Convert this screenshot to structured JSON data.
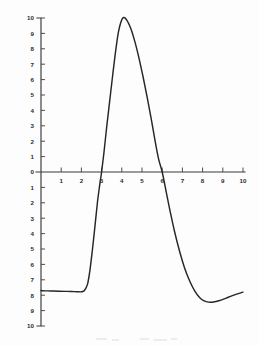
{
  "figure": {
    "title": "",
    "background_color": "#fdfdfd",
    "ink_color": "#262626",
    "axis_color": "#3a3a3a",
    "label_color": "#2b2b2b"
  },
  "chart_data": {
    "type": "line",
    "title": "",
    "subtitle": "",
    "xlabel": "",
    "ylabel": "",
    "xlim": [
      0,
      10.2
    ],
    "ylim": [
      -10,
      10
    ],
    "grid": false,
    "legend": null,
    "annotations": [],
    "x_tick_labels": [
      "1",
      "2",
      "3",
      "4",
      "5",
      "6",
      "7",
      "8",
      "9",
      "10"
    ],
    "x_tick_values": [
      1,
      2,
      3,
      4,
      5,
      6,
      7,
      8,
      9,
      10
    ],
    "y_tick_labels_upper": [
      "10",
      "9",
      "8",
      "7",
      "6",
      "5",
      "4",
      "3",
      "2",
      "1",
      "0"
    ],
    "y_tick_values_upper": [
      10,
      9,
      8,
      7,
      6,
      5,
      4,
      3,
      2,
      1,
      0
    ],
    "y_tick_labels_lower": [
      "1",
      "2",
      "3",
      "4",
      "5",
      "6",
      "7",
      "8",
      "9",
      "10"
    ],
    "y_tick_values_lower": [
      -1,
      -2,
      -3,
      -4,
      -5,
      -6,
      -7,
      -8,
      -9,
      -10
    ],
    "series": [
      {
        "name": "curve",
        "x": [
          0.0,
          0.3,
          0.6,
          0.9,
          1.2,
          1.5,
          1.75,
          2.0,
          2.15,
          2.3,
          2.42,
          2.55,
          2.68,
          2.8,
          2.9,
          3.0,
          3.12,
          3.25,
          3.4,
          3.55,
          3.7,
          3.85,
          4.05,
          4.25,
          4.45,
          4.65,
          4.85,
          5.05,
          5.25,
          5.45,
          5.65,
          5.82,
          6.0,
          6.2,
          6.4,
          6.6,
          6.85,
          7.1,
          7.35,
          7.6,
          7.85,
          8.05,
          8.3,
          8.6,
          8.95,
          9.3,
          9.65,
          10.0
        ],
        "y": [
          -7.7,
          -7.72,
          -7.73,
          -7.74,
          -7.75,
          -7.76,
          -7.77,
          -7.78,
          -7.7,
          -7.3,
          -6.4,
          -5.0,
          -3.4,
          -1.9,
          -0.9,
          0.0,
          1.3,
          2.9,
          4.6,
          6.3,
          7.9,
          9.2,
          10.0,
          9.85,
          9.3,
          8.45,
          7.4,
          6.2,
          4.9,
          3.5,
          2.0,
          0.85,
          0.0,
          -1.3,
          -2.6,
          -3.8,
          -5.1,
          -6.2,
          -7.05,
          -7.7,
          -8.15,
          -8.35,
          -8.45,
          -8.42,
          -8.3,
          -8.12,
          -7.95,
          -7.8
        ]
      }
    ]
  },
  "axes_geometry": {
    "origin_x_px": 41,
    "origin_y_px": 172,
    "x_unit_px": 20.2,
    "y_unit_px": 15.4,
    "y_axis_top_px": 18,
    "y_axis_bottom_px": 326,
    "x_axis_right_px": 245
  }
}
